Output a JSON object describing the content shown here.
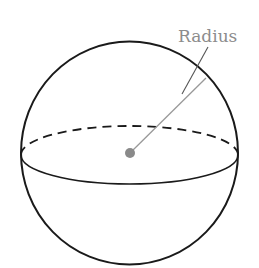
{
  "diagram": {
    "type": "sphere",
    "labels": {
      "radius": "Radius"
    },
    "colors": {
      "outline": "#1a1a1a",
      "label": "#8c8c8c",
      "radius_line": "#999999",
      "center_dot": "#8a8a8a",
      "background": "#ffffff"
    }
  }
}
